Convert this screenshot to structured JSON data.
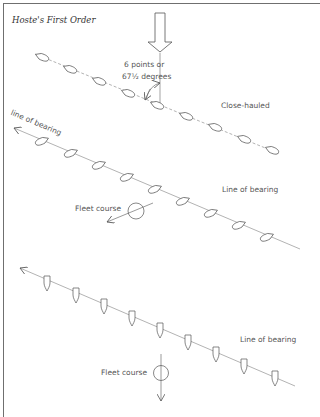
{
  "title": "Hoste's First Order",
  "angle_label": {
    "line1": "6 points or",
    "line2": "67½ degrees"
  },
  "formations": [
    {
      "name": "close-hauled",
      "label": "Close-hauled",
      "boat_orientation": "pointing-along-line",
      "boat_count": 9
    },
    {
      "name": "line-of-bearing-1",
      "label": "Line of bearing",
      "arrow_label": "line of bearing",
      "fleet_course_label": "Fleet course",
      "boat_orientation": "pointing-along-line",
      "boat_count": 9
    },
    {
      "name": "line-of-bearing-2",
      "label": "Line of bearing",
      "fleet_course_label": "Fleet course",
      "boat_orientation": "pointing-down",
      "boat_count": 9
    }
  ],
  "wind_arrow": "down",
  "colors": {
    "ink": "#555555",
    "frame": "#6f6f6f",
    "background": "#ffffff"
  }
}
